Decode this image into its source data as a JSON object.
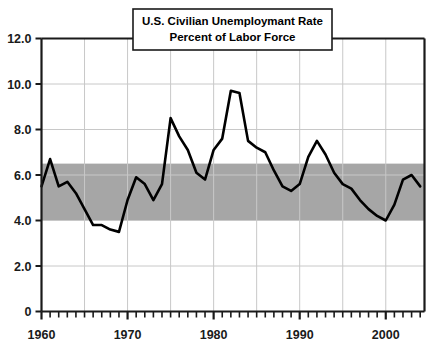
{
  "chart_data": {
    "type": "line",
    "title": "U.S. Civilian Unemploymant Rate",
    "subtitle": "Percent of Labor Force",
    "xlabel": "",
    "ylabel": "",
    "xlim": [
      1960,
      2004.5
    ],
    "ylim": [
      0,
      12
    ],
    "grid": true,
    "legend": null,
    "y_ticks": [
      0,
      2,
      4,
      6,
      8,
      10,
      12
    ],
    "y_tick_labels": [
      "0",
      "2.0",
      "4.0",
      "6.0",
      "8.0",
      "10.0",
      "12.0"
    ],
    "x_ticks": [
      1960,
      1970,
      1980,
      1990,
      2000
    ],
    "x_tick_labels": [
      "1960",
      "1970",
      "1980",
      "1990",
      "2000"
    ],
    "x_minor_tick_interval": 1,
    "x_gridline_interval": 5,
    "shaded_band": {
      "label": "shaded range band",
      "y_from": 4.0,
      "y_to": 6.5,
      "color": "#a6a6a6"
    },
    "series": [
      {
        "name": "U.S. Civilian Unemployment Rate",
        "color": "#000000",
        "x": [
          1960,
          1961,
          1962,
          1963,
          1964,
          1965,
          1966,
          1967,
          1968,
          1969,
          1970,
          1971,
          1972,
          1973,
          1974,
          1975,
          1976,
          1977,
          1978,
          1979,
          1980,
          1981,
          1982,
          1983,
          1984,
          1985,
          1986,
          1987,
          1988,
          1989,
          1990,
          1991,
          1992,
          1993,
          1994,
          1995,
          1996,
          1997,
          1998,
          1999,
          2000,
          2001,
          2002,
          2003,
          2004
        ],
        "values": [
          5.5,
          6.7,
          5.5,
          5.7,
          5.2,
          4.5,
          3.8,
          3.8,
          3.6,
          3.5,
          4.9,
          5.9,
          5.6,
          4.9,
          5.6,
          8.5,
          7.7,
          7.1,
          6.1,
          5.8,
          7.1,
          7.6,
          9.7,
          9.6,
          7.5,
          7.2,
          7.0,
          6.2,
          5.5,
          5.3,
          5.6,
          6.8,
          7.5,
          6.9,
          6.1,
          5.6,
          5.4,
          4.9,
          4.5,
          4.2,
          4.0,
          4.7,
          5.8,
          6.0,
          5.5
        ]
      }
    ]
  },
  "titlebox": {
    "line1": "U.S. Civilian Unemploymant Rate",
    "line2": "Percent of Labor Force"
  },
  "axes": {
    "y_labels": [
      "12.0",
      "10.0",
      "8.0",
      "6.0",
      "4.0",
      "2.0",
      "0"
    ],
    "x_labels": [
      "1960",
      "1970",
      "1980",
      "1990",
      "2000"
    ]
  },
  "colors": {
    "line": "#000000",
    "band": "#a6a6a6",
    "grid": "#c8c8c8",
    "frame": "#1a1a1a",
    "background": "#ffffff"
  }
}
